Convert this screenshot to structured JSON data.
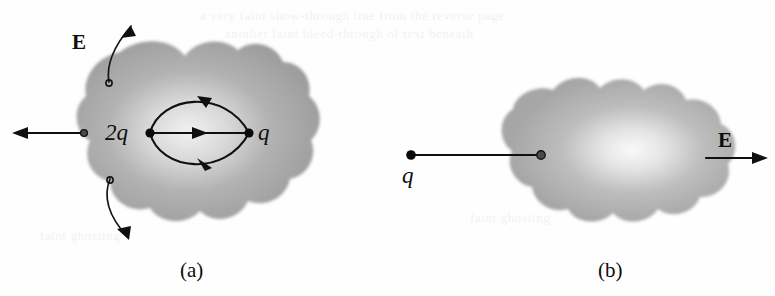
{
  "figure": {
    "background_color": "#fefefe",
    "blob_color": "#a8a8a8",
    "ink_color": "#101010"
  },
  "panel_a": {
    "caption": "(a)",
    "field_label": "E",
    "charge_inner_left": "2q",
    "charge_inner_right": "q",
    "description": "Closed irregular Gaussian surface enclosing charges 2q and q joined by three electric field lines; field arrows exit the surface at left, upper-left and lower-left."
  },
  "panel_b": {
    "caption": "(b)",
    "field_label": "E",
    "charge_outside": "q",
    "description": "Closed irregular Gaussian surface with an external point charge q connected by a line to a point inside the surface; field arrow points to the right outside the surface."
  },
  "ghosts": [
    {
      "text": "a very faint show-through line from the reverse page",
      "x": 200,
      "y": 14
    },
    {
      "text": "another faint bleed-through of text beneath",
      "x": 225,
      "y": 32
    },
    {
      "text": "faint ghosting",
      "x": 470,
      "y": 216
    },
    {
      "text": "faint ghosting",
      "x": 40,
      "y": 232
    }
  ]
}
